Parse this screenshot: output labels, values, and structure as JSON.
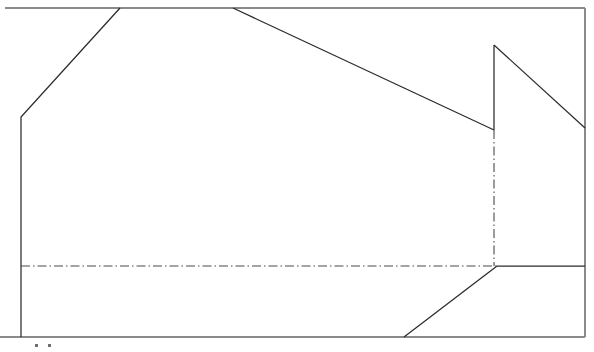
{
  "document": {
    "title": "Technical Line Drawing",
    "description": "Cropped engineering elevation outline with dash-dot centerlines"
  },
  "canvas": {
    "width": 594,
    "height": 352,
    "background": "#ffffff"
  },
  "colors": {
    "outline": "#2b2b2b",
    "frame": "#8a8a8a",
    "centerline": "#4a4a4a",
    "crop_mark": "#6f6f6f"
  },
  "frame": {
    "name": "drawing-border",
    "top_y": 8,
    "bottom_y": 337,
    "right_x": 585,
    "left_x": 5,
    "segments": [
      {
        "name": "top-border",
        "x1": 5,
        "y1": 8,
        "x2": 585,
        "y2": 8
      },
      {
        "name": "right-border",
        "x1": 585,
        "y1": 8,
        "x2": 585,
        "y2": 337
      },
      {
        "name": "bottom-border",
        "x1": 0,
        "y1": 337,
        "x2": 585,
        "y2": 337
      }
    ]
  },
  "outline": {
    "name": "building-profile",
    "paths": [
      {
        "name": "left-wall-and-roof-slope",
        "points": [
          [
            21,
            337
          ],
          [
            21,
            117
          ],
          [
            120,
            8
          ]
        ]
      },
      {
        "name": "main-roof-descending-slope",
        "points": [
          [
            233,
            8
          ],
          [
            494,
            130
          ]
        ]
      },
      {
        "name": "dormer-riser",
        "points": [
          [
            494,
            130
          ],
          [
            494,
            45
          ]
        ]
      },
      {
        "name": "dormer-descending-slope",
        "points": [
          [
            494,
            45
          ],
          [
            585,
            128
          ]
        ]
      },
      {
        "name": "lower-right-horizontal-ledge",
        "points": [
          [
            497,
            266
          ],
          [
            585,
            266
          ]
        ]
      },
      {
        "name": "lower-ascending-diagonal",
        "points": [
          [
            404,
            337
          ],
          [
            497,
            266
          ]
        ]
      }
    ]
  },
  "centerlines": {
    "name": "dash-dot-centerlines",
    "paths": [
      {
        "name": "horizontal-centerline",
        "points": [
          [
            21,
            266
          ],
          [
            497,
            266
          ]
        ]
      },
      {
        "name": "vertical-centerline",
        "points": [
          [
            494,
            130
          ],
          [
            494,
            266
          ]
        ]
      }
    ]
  },
  "crop_marks": {
    "name": "cropped-label-marks",
    "marks": [
      {
        "name": "crop-mark-left",
        "x": 35,
        "y": 344,
        "w": 3,
        "h": 3
      },
      {
        "name": "crop-mark-right",
        "x": 48,
        "y": 344,
        "w": 3,
        "h": 3
      }
    ]
  }
}
